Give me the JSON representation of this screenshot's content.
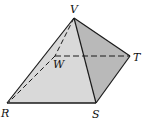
{
  "diagram": {
    "type": "pyramid",
    "labels": {
      "V": "V",
      "W": "W",
      "T": "T",
      "R": "R",
      "S": "S"
    },
    "colors": {
      "front_face": "#d9d9d9",
      "right_face": "#b9b9b9",
      "edge": "#1a1a1a",
      "background": "#ffffff"
    },
    "vertices": {
      "V": [
        74,
        18
      ],
      "W": [
        55,
        56
      ],
      "T": [
        130,
        56
      ],
      "R": [
        7,
        103
      ],
      "S": [
        96,
        103
      ]
    },
    "solid_edges": [
      "V-R",
      "V-S",
      "V-T",
      "R-S",
      "S-T"
    ],
    "hidden_edges": [
      "V-W",
      "W-R",
      "W-T"
    ]
  }
}
